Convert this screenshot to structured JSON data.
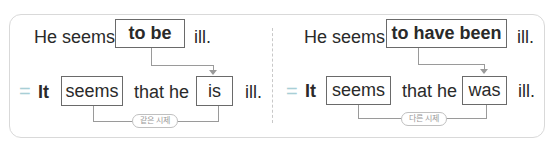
{
  "left": {
    "row1": {
      "prefix": "He seems",
      "boxed": "to be",
      "suffix": "ill."
    },
    "row2": {
      "equals": "=",
      "it": "It",
      "boxed_verb": "seems",
      "middle": "that he",
      "boxed_tense": "is",
      "suffix": "ill."
    },
    "tense_label": "같은 시제"
  },
  "right": {
    "row1": {
      "prefix": "He seems",
      "boxed": "to have been",
      "suffix": "ill."
    },
    "row2": {
      "equals": "=",
      "it": "It",
      "boxed_verb": "seems",
      "middle": "that he",
      "boxed_tense": "was",
      "suffix": "ill."
    },
    "tense_label": "다른 시제"
  },
  "colors": {
    "box_border": "#6a6a6a",
    "equals": "#a9cfd6",
    "connector": "#9a9a9a",
    "panel_border": "#d9d9d9"
  }
}
